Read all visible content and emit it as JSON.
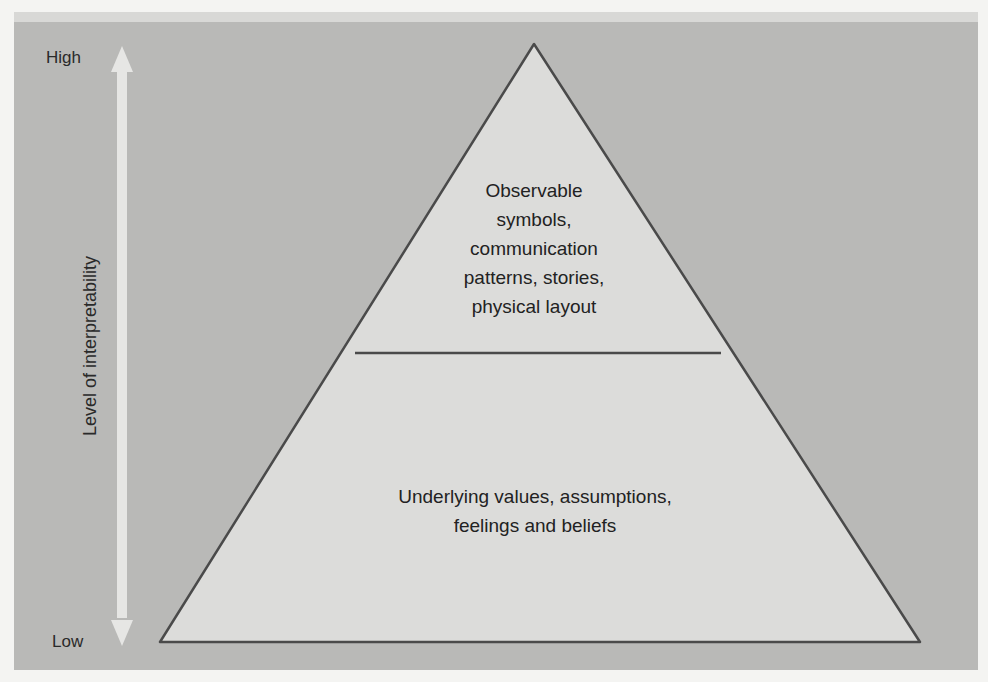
{
  "axis": {
    "label": "Level of interpretability",
    "high_label": "High",
    "low_label": "Low",
    "arrow_icon": "double-headed-vertical-arrow"
  },
  "pyramid": {
    "top_tier": {
      "lines": [
        "Observable",
        "symbols,",
        "communication",
        "patterns, stories,",
        "physical layout"
      ]
    },
    "bottom_tier": {
      "lines": [
        "Underlying values, assumptions,",
        "feelings and beliefs"
      ]
    }
  },
  "colors": {
    "panel": "#b9b9b7",
    "triangle_fill": "#dcdcda",
    "triangle_stroke": "#4a4a4a",
    "arrow": "#e6e6e4"
  }
}
